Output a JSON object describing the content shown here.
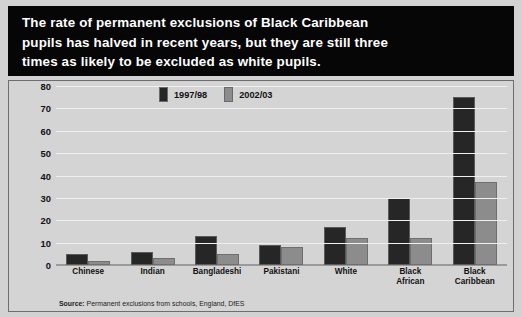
{
  "title": {
    "lines": [
      "The rate of permanent exclusions of Black Caribbean",
      "pupils has halved in recent years, but they are still three",
      "times as likely to be excluded as white pupils."
    ]
  },
  "source": {
    "prefix": "Source:",
    "text": " Permanent exclusions from schools, England, DfES"
  },
  "colors": {
    "series_1997_98": "#262626",
    "series_2002_03": "#8c8c8c",
    "panel_background": "#d4d4d4",
    "title_background": "#060606",
    "title_text": "#ffffff",
    "gridline": "#efefef"
  },
  "chart_data": {
    "type": "bar",
    "title": "The rate of permanent exclusions of Black Caribbean pupils has halved in recent years, but they are still three times as likely to be excluded as white pupils.",
    "xlabel": "",
    "ylabel": "Pupils permanently excluded by ethnic group in England per 10,000 pupils of that ethnic group",
    "ylim": [
      0,
      80
    ],
    "ytick_labels": [
      "80",
      "70",
      "60",
      "50",
      "40",
      "30",
      "20",
      "10",
      "0"
    ],
    "ytick_values": [
      80,
      70,
      60,
      50,
      40,
      30,
      20,
      10,
      0
    ],
    "grid": true,
    "legend_position": "top-left-inside",
    "categories": [
      "Chinese",
      "Indian",
      "Bangladeshi",
      "Pakistani",
      "White",
      "Black African",
      "Black Caribbean"
    ],
    "category_lines": [
      [
        "Chinese"
      ],
      [
        "Indian"
      ],
      [
        "Bangladeshi"
      ],
      [
        "Pakistani"
      ],
      [
        "White"
      ],
      [
        "Black",
        "African"
      ],
      [
        "Black",
        "Caribbean"
      ]
    ],
    "series": [
      {
        "name": "1997/98",
        "color": "#262626",
        "values": [
          5,
          6,
          13,
          9,
          17,
          30,
          75
        ]
      },
      {
        "name": "2002/03",
        "color": "#8c8c8c",
        "values": [
          2,
          3,
          5,
          8,
          12,
          12,
          37
        ]
      }
    ]
  }
}
